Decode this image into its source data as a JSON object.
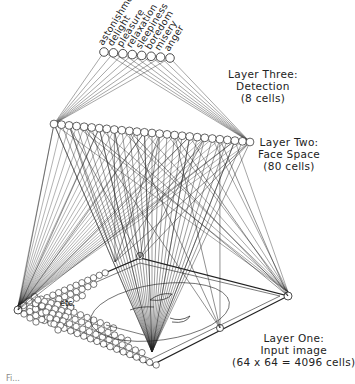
{
  "layers": {
    "three": {
      "line1": "Layer Three:",
      "line2": "Detection",
      "line3": "(8 cells)"
    },
    "two": {
      "line1": "Layer Two:",
      "line2": "Face Space",
      "line3": "(80 cells)"
    },
    "one": {
      "line1": "Layer One:",
      "line2": "Input image",
      "line3": "(64 x 64 = 4096 cells)"
    }
  },
  "detection_cells": [
    "astonishment",
    "delight",
    "pleasure",
    "relaxation",
    "sleepiness",
    "boredom",
    "misery",
    "anger"
  ],
  "etc_label": "etc.",
  "caption_fragment": "Fi...",
  "colors": {
    "ink": "#222222",
    "background": "#ffffff"
  }
}
